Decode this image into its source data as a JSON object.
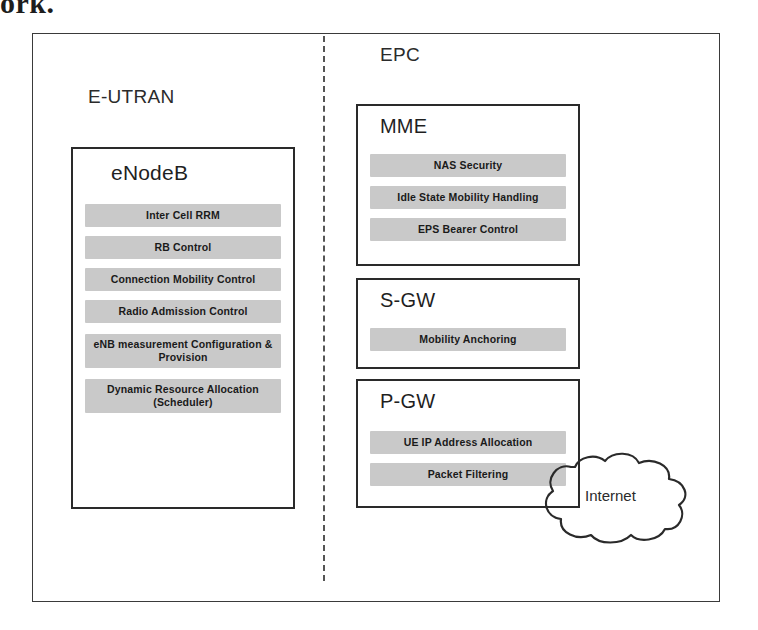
{
  "caption_fragment": "ork.",
  "figure": {
    "domains": [
      {
        "id": "eutran",
        "label": "E-UTRAN"
      },
      {
        "id": "epc",
        "label": "EPC"
      }
    ],
    "nodes": [
      {
        "id": "enodeb",
        "title": "eNodeB",
        "functions": [
          "Inter Cell RRM",
          "RB Control",
          "Connection Mobility Control",
          "Radio Admission Control",
          "eNB measurement Configuration & Provision",
          "Dynamic Resource Allocation (Scheduler)"
        ]
      },
      {
        "id": "mme",
        "title": "MME",
        "functions": [
          "NAS Security",
          "Idle State Mobility Handling",
          "EPS Bearer Control"
        ]
      },
      {
        "id": "sgw",
        "title": "S-GW",
        "functions": [
          "Mobility Anchoring"
        ]
      },
      {
        "id": "pgw",
        "title": "P-GW",
        "functions": [
          "UE IP Address Allocation",
          "Packet Filtering"
        ]
      }
    ],
    "external": {
      "internet_label": "Internet"
    },
    "colors": {
      "function_block_fill": "#c9c9c9",
      "box_border": "#2a2a2a",
      "frame_border": "#3a3a3a",
      "divider": "#555555",
      "text": "#1f1f1f"
    }
  }
}
